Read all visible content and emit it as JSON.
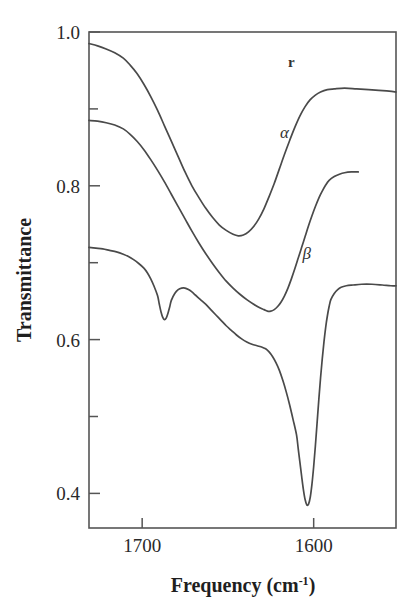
{
  "figure": {
    "kind": "line-plot",
    "background_color": "#ffffff",
    "line_color": "#4a4a4a",
    "axis_color": "#555555",
    "text_color": "#2a2a2a"
  },
  "chart_data": {
    "type": "line",
    "title": "",
    "xlabel": "Frequency (cm",
    "xlabel_sup": "-1",
    "xlabel_tail": ")",
    "xlabel_full": "Frequency (cm^-1)",
    "ylabel": "Transmittance",
    "xlim": [
      1731,
      1552
    ],
    "ylim": [
      0.355,
      1.0
    ],
    "x_inverted": true,
    "grid": false,
    "legend": "inline-curve-labels",
    "xticks": [
      1700,
      1600
    ],
    "xticklabels": [
      "1700",
      "1600"
    ],
    "yticks": [
      1.0,
      0.9,
      0.8,
      0.7,
      0.6,
      0.5,
      0.4
    ],
    "yticklabels": [
      "1.0",
      "",
      "0.8",
      "",
      "0.6",
      "",
      "0.4"
    ],
    "ytick_labeled": [
      1.0,
      0.8,
      0.6,
      0.4
    ],
    "series": [
      {
        "name": "gamma",
        "label": "r",
        "label_x": 1613,
        "label_y": 0.955,
        "points": [
          [
            1731,
            0.985
          ],
          [
            1726,
            0.982
          ],
          [
            1721,
            0.978
          ],
          [
            1716,
            0.973
          ],
          [
            1711,
            0.966
          ],
          [
            1707,
            0.957
          ],
          [
            1703,
            0.946
          ],
          [
            1699,
            0.932
          ],
          [
            1695,
            0.916
          ],
          [
            1691,
            0.898
          ],
          [
            1687,
            0.878
          ],
          [
            1683,
            0.858
          ],
          [
            1679,
            0.838
          ],
          [
            1675,
            0.818
          ],
          [
            1671,
            0.8
          ],
          [
            1667,
            0.785
          ],
          [
            1663,
            0.771
          ],
          [
            1659,
            0.759
          ],
          [
            1655,
            0.749
          ],
          [
            1651,
            0.742
          ],
          [
            1647,
            0.737
          ],
          [
            1644,
            0.735
          ],
          [
            1641,
            0.736
          ],
          [
            1638,
            0.74
          ],
          [
            1635,
            0.747
          ],
          [
            1632,
            0.757
          ],
          [
            1629,
            0.77
          ],
          [
            1626,
            0.786
          ],
          [
            1623,
            0.803
          ],
          [
            1620,
            0.822
          ],
          [
            1617,
            0.841
          ],
          [
            1614,
            0.859
          ],
          [
            1611,
            0.876
          ],
          [
            1608,
            0.891
          ],
          [
            1605,
            0.903
          ],
          [
            1602,
            0.912
          ],
          [
            1599,
            0.918
          ],
          [
            1596,
            0.922
          ],
          [
            1592,
            0.925
          ],
          [
            1588,
            0.926
          ],
          [
            1582,
            0.927
          ],
          [
            1575,
            0.926
          ],
          [
            1568,
            0.925
          ],
          [
            1562,
            0.924
          ],
          [
            1556,
            0.923
          ],
          [
            1552,
            0.922
          ]
        ]
      },
      {
        "name": "alpha",
        "label": "α",
        "label_x": 1617,
        "label_y": 0.862,
        "points": [
          [
            1731,
            0.885
          ],
          [
            1726,
            0.884
          ],
          [
            1721,
            0.882
          ],
          [
            1716,
            0.879
          ],
          [
            1711,
            0.874
          ],
          [
            1707,
            0.867
          ],
          [
            1703,
            0.858
          ],
          [
            1699,
            0.847
          ],
          [
            1695,
            0.834
          ],
          [
            1691,
            0.82
          ],
          [
            1687,
            0.805
          ],
          [
            1683,
            0.789
          ],
          [
            1679,
            0.773
          ],
          [
            1675,
            0.757
          ],
          [
            1671,
            0.741
          ],
          [
            1667,
            0.726
          ],
          [
            1663,
            0.712
          ],
          [
            1659,
            0.699
          ],
          [
            1655,
            0.687
          ],
          [
            1651,
            0.676
          ],
          [
            1647,
            0.667
          ],
          [
            1643,
            0.659
          ],
          [
            1639,
            0.652
          ],
          [
            1635,
            0.646
          ],
          [
            1632,
            0.642
          ],
          [
            1629,
            0.639
          ],
          [
            1627,
            0.637
          ],
          [
            1625,
            0.637
          ],
          [
            1623,
            0.639
          ],
          [
            1621,
            0.643
          ],
          [
            1619,
            0.649
          ],
          [
            1617,
            0.657
          ],
          [
            1615,
            0.667
          ],
          [
            1613,
            0.679
          ],
          [
            1611,
            0.692
          ],
          [
            1609,
            0.706
          ],
          [
            1607,
            0.72
          ],
          [
            1605,
            0.734
          ],
          [
            1603,
            0.748
          ],
          [
            1601,
            0.761
          ],
          [
            1599,
            0.773
          ],
          [
            1597,
            0.784
          ],
          [
            1595,
            0.793
          ],
          [
            1593,
            0.801
          ],
          [
            1591,
            0.807
          ],
          [
            1588,
            0.812
          ],
          [
            1585,
            0.815
          ],
          [
            1582,
            0.817
          ],
          [
            1578,
            0.818
          ],
          [
            1574,
            0.818
          ]
        ]
      },
      {
        "name": "beta",
        "label": "β",
        "label_x": 1604,
        "label_y": 0.705,
        "points": [
          [
            1731,
            0.72
          ],
          [
            1727,
            0.719
          ],
          [
            1723,
            0.718
          ],
          [
            1719,
            0.716
          ],
          [
            1715,
            0.714
          ],
          [
            1711,
            0.711
          ],
          [
            1708,
            0.708
          ],
          [
            1705,
            0.704
          ],
          [
            1702,
            0.699
          ],
          [
            1699,
            0.693
          ],
          [
            1697,
            0.687
          ],
          [
            1695,
            0.679
          ],
          [
            1693,
            0.669
          ],
          [
            1691,
            0.657
          ],
          [
            1690,
            0.646
          ],
          [
            1689,
            0.636
          ],
          [
            1688,
            0.629
          ],
          [
            1687,
            0.626
          ],
          [
            1686,
            0.628
          ],
          [
            1685,
            0.634
          ],
          [
            1684,
            0.642
          ],
          [
            1683,
            0.651
          ],
          [
            1681,
            0.66
          ],
          [
            1679,
            0.665
          ],
          [
            1677,
            0.667
          ],
          [
            1675,
            0.667
          ],
          [
            1673,
            0.665
          ],
          [
            1671,
            0.662
          ],
          [
            1669,
            0.658
          ],
          [
            1666,
            0.652
          ],
          [
            1663,
            0.646
          ],
          [
            1660,
            0.639
          ],
          [
            1657,
            0.632
          ],
          [
            1654,
            0.625
          ],
          [
            1651,
            0.618
          ],
          [
            1648,
            0.612
          ],
          [
            1645,
            0.606
          ],
          [
            1642,
            0.601
          ],
          [
            1639,
            0.597
          ],
          [
            1636,
            0.594
          ],
          [
            1633,
            0.592
          ],
          [
            1630,
            0.59
          ],
          [
            1628,
            0.588
          ],
          [
            1626,
            0.584
          ],
          [
            1624,
            0.578
          ],
          [
            1622,
            0.57
          ],
          [
            1620,
            0.56
          ],
          [
            1618,
            0.547
          ],
          [
            1616,
            0.532
          ],
          [
            1614,
            0.515
          ],
          [
            1612,
            0.496
          ],
          [
            1610,
            0.476
          ],
          [
            1609,
            0.458
          ],
          [
            1608,
            0.44
          ],
          [
            1607,
            0.422
          ],
          [
            1606,
            0.405
          ],
          [
            1605,
            0.392
          ],
          [
            1604,
            0.385
          ],
          [
            1603,
            0.386
          ],
          [
            1602,
            0.395
          ],
          [
            1601,
            0.412
          ],
          [
            1600,
            0.435
          ],
          [
            1599,
            0.462
          ],
          [
            1598,
            0.492
          ],
          [
            1597,
            0.522
          ],
          [
            1596,
            0.55
          ],
          [
            1595,
            0.575
          ],
          [
            1594,
            0.597
          ],
          [
            1593,
            0.616
          ],
          [
            1592,
            0.631
          ],
          [
            1591,
            0.643
          ],
          [
            1590,
            0.652
          ],
          [
            1588,
            0.66
          ],
          [
            1586,
            0.665
          ],
          [
            1584,
            0.668
          ],
          [
            1581,
            0.67
          ],
          [
            1577,
            0.671
          ],
          [
            1572,
            0.672
          ],
          [
            1566,
            0.672
          ],
          [
            1560,
            0.671
          ],
          [
            1555,
            0.67
          ],
          [
            1552,
            0.67
          ]
        ]
      }
    ]
  }
}
